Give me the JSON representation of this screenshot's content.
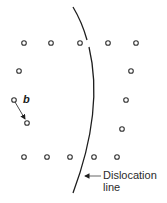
{
  "diagram": {
    "colors": {
      "line": "#1e1e1e",
      "atom_stroke": "#333333",
      "label": "#2b2b2b",
      "background": "#ffffff"
    },
    "atoms": {
      "top_row": [
        [
          24,
          43
        ],
        [
          51,
          43
        ],
        [
          80,
          43
        ],
        [
          108,
          43
        ],
        [
          136,
          43
        ]
      ],
      "left_column": [
        [
          19,
          71
        ],
        [
          14,
          100
        ],
        [
          27,
          123
        ]
      ],
      "right_column": [
        [
          131,
          71
        ],
        [
          126,
          100
        ],
        [
          122,
          129
        ]
      ],
      "bottom_row": [
        [
          24,
          157
        ],
        [
          47,
          157
        ],
        [
          70,
          157
        ],
        [
          94,
          157
        ],
        [
          117,
          157
        ]
      ]
    },
    "burgers_vector": {
      "label": "b",
      "from": [
        14,
        100
      ],
      "to": [
        26,
        120
      ]
    },
    "dislocation_label": {
      "line1": "Dislocation",
      "line2": "line"
    }
  }
}
